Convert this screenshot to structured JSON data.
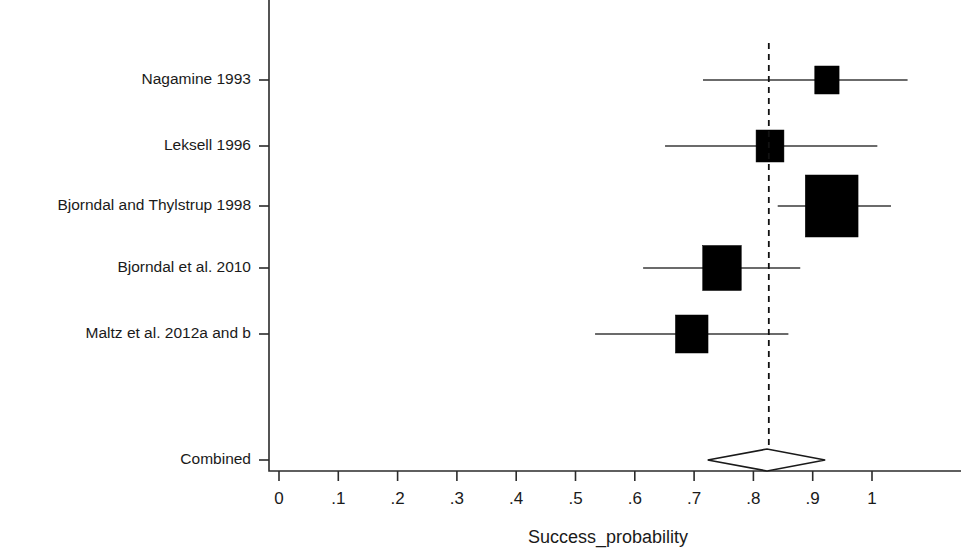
{
  "chart_data": {
    "type": "forest",
    "title": "",
    "xlabel": "Success_probability",
    "ylabel": "",
    "xlim": [
      0,
      1.06
    ],
    "xticks": [
      0,
      0.1,
      0.2,
      0.3,
      0.4,
      0.5,
      0.6,
      0.7,
      0.8,
      0.9,
      1
    ],
    "xticklabels": [
      "0",
      ".1",
      ".2",
      ".3",
      ".4",
      ".5",
      ".6",
      ".7",
      ".8",
      ".9",
      "1"
    ],
    "grid": false,
    "legend": null,
    "reference_line": 0.826,
    "studies": [
      {
        "label": "Nagamine 1993",
        "estimate": 0.924,
        "ci_low": 0.715,
        "ci_high": 1.06,
        "ci_high_clipped": true,
        "weight_box_width": 0.041,
        "weight_box_height": 28
      },
      {
        "label": "Leksell 1996",
        "estimate": 0.828,
        "ci_low": 0.651,
        "ci_high": 1.009,
        "ci_high_clipped": false,
        "weight_box_width": 0.047,
        "weight_box_height": 32
      },
      {
        "label": "Bjorndal and Thylstrup 1998",
        "estimate": 0.932,
        "ci_low": 0.841,
        "ci_high": 1.032,
        "ci_high_clipped": false,
        "weight_box_width": 0.089,
        "weight_box_height": 62
      },
      {
        "label": "Bjorndal et al. 2010",
        "estimate": 0.747,
        "ci_low": 0.614,
        "ci_high": 0.879,
        "ci_high_clipped": false,
        "weight_box_width": 0.065,
        "weight_box_height": 45
      },
      {
        "label": "Maltz et al. 2012a and b",
        "estimate": 0.696,
        "ci_low": 0.533,
        "ci_high": 0.859,
        "ci_high_clipped": false,
        "weight_box_width": 0.055,
        "weight_box_height": 38
      }
    ],
    "combined": {
      "label": "Combined",
      "estimate": 0.823,
      "ci_low": 0.723,
      "ci_high": 0.921
    }
  }
}
